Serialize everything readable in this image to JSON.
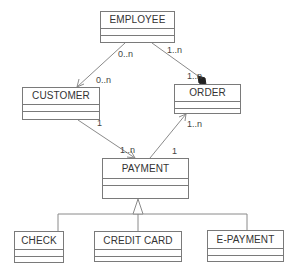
{
  "diagram": {
    "type": "uml-class-diagram",
    "classes": [
      {
        "id": "employee",
        "name": "EMPLOYEE"
      },
      {
        "id": "customer",
        "name": "CUSTOMER"
      },
      {
        "id": "order",
        "name": "ORDER"
      },
      {
        "id": "payment",
        "name": "PAYMENT"
      },
      {
        "id": "check",
        "name": "CHECK"
      },
      {
        "id": "credit_card",
        "name": "CREDIT CARD"
      },
      {
        "id": "e_payment",
        "name": "E-PAYMENT"
      }
    ],
    "relationships": [
      {
        "from": "EMPLOYEE",
        "to": "CUSTOMER",
        "kind": "association",
        "from_mult": "0..n",
        "to_mult": "0..n"
      },
      {
        "from": "EMPLOYEE",
        "to": "ORDER",
        "kind": "composition",
        "from_mult": "1..n",
        "to_mult": "1..n"
      },
      {
        "from": "CUSTOMER",
        "to": "PAYMENT",
        "kind": "association",
        "from_mult": "1",
        "to_mult": "1..n"
      },
      {
        "from": "PAYMENT",
        "to": "ORDER",
        "kind": "association",
        "from_mult": "1",
        "to_mult": "1..n"
      },
      {
        "from": "CHECK",
        "to": "PAYMENT",
        "kind": "generalization"
      },
      {
        "from": "CREDIT CARD",
        "to": "PAYMENT",
        "kind": "generalization"
      },
      {
        "from": "E-PAYMENT",
        "to": "PAYMENT",
        "kind": "generalization"
      }
    ],
    "multiplicities": {
      "emp_cust_src": "0..n",
      "emp_cust_dst": "0..n",
      "emp_order_src": "1..n",
      "emp_order_dst": "1..n",
      "cust_pay_src": "1",
      "cust_pay_dst": "1..n",
      "pay_order_src": "1",
      "pay_order_dst": "1..n"
    },
    "colors": {
      "line": "#7a7a7a",
      "text": "#333333",
      "background": "#ffffff"
    }
  }
}
